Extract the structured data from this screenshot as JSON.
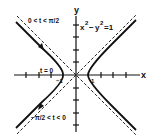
{
  "diagram": {
    "equation": "x²−y²=1",
    "equation_base_x": "x",
    "equation_base_y": "y",
    "equation_exp": "2",
    "equation_rest": "−1",
    "axis_labels": {
      "x": "x",
      "y": "y"
    },
    "tick_labels": {
      "pos_one": "1",
      "neg_one": "−1"
    },
    "annotations": {
      "upper_branch": "0 < t < π/2",
      "lower_branch": "−π/2 < t < 0",
      "vertex": "t = 0"
    },
    "colors": {
      "curve": "#111111",
      "asymptote": "#222222",
      "axis": "#111111",
      "background": "#ffffff"
    }
  }
}
